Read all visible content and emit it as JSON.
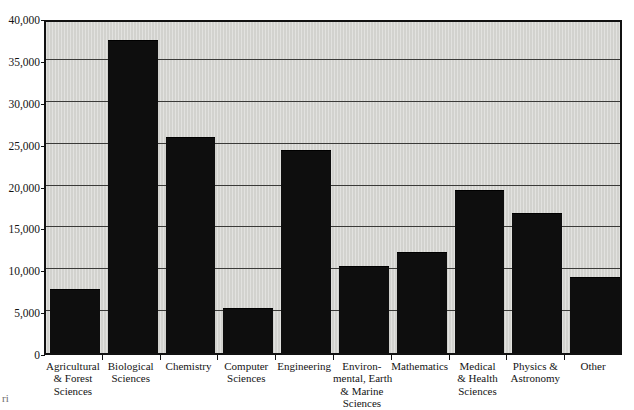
{
  "chart_data": {
    "type": "bar",
    "title": "",
    "subtitle": "",
    "xlabel": "",
    "ylabel": "",
    "categories": [
      "Agricultural & Forest Sciences",
      "Biological Sciences",
      "Chemistry",
      "Computer Sciences",
      "Engineering",
      "Environmental, Earth & Marine Sciences",
      "Mathematics",
      "Medical & Health Sciences",
      "Physics & Astronomy",
      "Other"
    ],
    "category_lines": [
      [
        "Agricultural",
        "& Forest",
        "Sciences"
      ],
      [
        "Biological",
        "Sciences"
      ],
      [
        "Chemistry"
      ],
      [
        "Computer",
        "Sciences"
      ],
      [
        "Engineering"
      ],
      [
        "Environ-",
        "mental, Earth",
        "& Marine",
        "Sciences"
      ],
      [
        "Mathematics"
      ],
      [
        "Medical",
        "& Health",
        "Sciences"
      ],
      [
        "Physics &",
        "Astronomy"
      ],
      [
        "Other"
      ]
    ],
    "values": [
      7500,
      37200,
      25700,
      5300,
      24100,
      10300,
      11900,
      19400,
      16600,
      9000
    ],
    "ylim": [
      0,
      40000
    ],
    "ytick_values": [
      0,
      5000,
      10000,
      15000,
      20000,
      25000,
      30000,
      35000,
      40000
    ],
    "ytick_labels": [
      "0",
      "5,000",
      "10,000",
      "15,000",
      "20,000",
      "25,000",
      "30,000",
      "35,000",
      "40,000"
    ],
    "grid": true,
    "legend": "none",
    "colors": {
      "bar": "#0e0e0e",
      "plot_background": "#d2d2ce",
      "gridline": "#3a3a38",
      "axis": "#111111",
      "page_background": "#ffffff"
    }
  },
  "artifact": {
    "scan_mark": "ri"
  }
}
